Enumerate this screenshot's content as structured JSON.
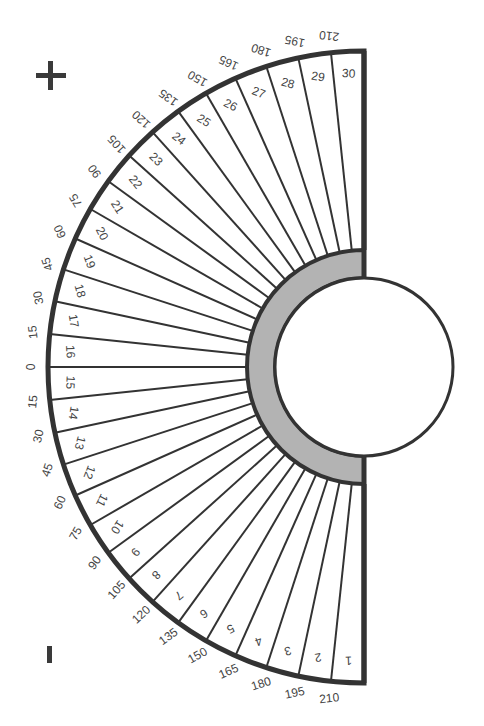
{
  "diagram": {
    "type": "semicircular-dial",
    "plus_sign": "+",
    "minus_sign": "-",
    "segments": {
      "count": 30,
      "labels": [
        "1",
        "2",
        "3",
        "4",
        "5",
        "6",
        "7",
        "8",
        "9",
        "10",
        "11",
        "12",
        "13",
        "14",
        "15",
        "16",
        "17",
        "18",
        "19",
        "20",
        "21",
        "22",
        "23",
        "24",
        "25",
        "26",
        "27",
        "28",
        "29",
        "30"
      ],
      "order": "bottom-to-top"
    },
    "outer_scale": {
      "upper": [
        "0",
        "15",
        "30",
        "45",
        "60",
        "75",
        "90",
        "105",
        "120",
        "135",
        "150",
        "165",
        "180",
        "195",
        "210"
      ],
      "lower": [
        "15",
        "30",
        "45",
        "60",
        "75",
        "90",
        "105",
        "120",
        "135",
        "150",
        "165",
        "180",
        "195",
        "210"
      ],
      "center_label": "0"
    },
    "colors": {
      "stroke": "#333333",
      "band": "#b3b3b3",
      "background": "#ffffff",
      "text": "#444444"
    }
  }
}
